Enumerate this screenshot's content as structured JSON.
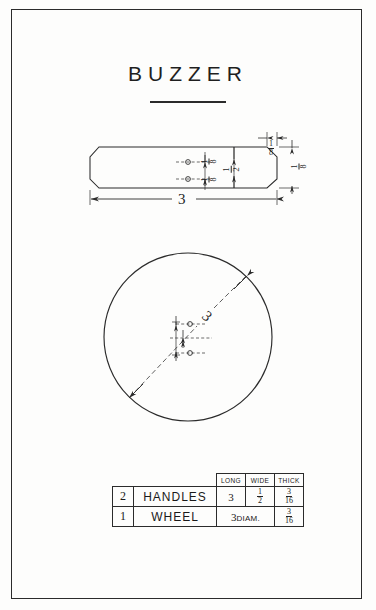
{
  "sheet": {
    "title": "BUZZER",
    "border_color": "#2b2b2b",
    "ink_color": "#1f1f1f",
    "paper_color": "#fdfdfc"
  },
  "top_view": {
    "name": "handle-top-view",
    "overall_length_label": "3",
    "width_label_num": "1",
    "width_label_den": "2",
    "hole_spacing_upper_num": "1",
    "hole_spacing_upper_den": "8",
    "hole_spacing_lower_num": "1",
    "hole_spacing_lower_den": "8",
    "chamfer_label_num": "1",
    "chamfer_label_den": "8",
    "thickness_label_num": "1",
    "thickness_label_den": "8"
  },
  "wheel_view": {
    "name": "wheel-plan-view",
    "diameter_label": "3"
  },
  "parts_table": {
    "headers": [
      "",
      "",
      "LONG",
      "WIDE",
      "THICK"
    ],
    "rows": [
      {
        "qty": "2",
        "part": "HANDLES",
        "long": "3",
        "wide_num": "1",
        "wide_den": "2",
        "thick_num": "3",
        "thick_den": "16",
        "spans_long_wide": false
      },
      {
        "qty": "1",
        "part": "WHEEL",
        "diam_value": "3",
        "diam_unit": "DIAM.",
        "thick_num": "3",
        "thick_den": "16",
        "spans_long_wide": true
      }
    ]
  }
}
